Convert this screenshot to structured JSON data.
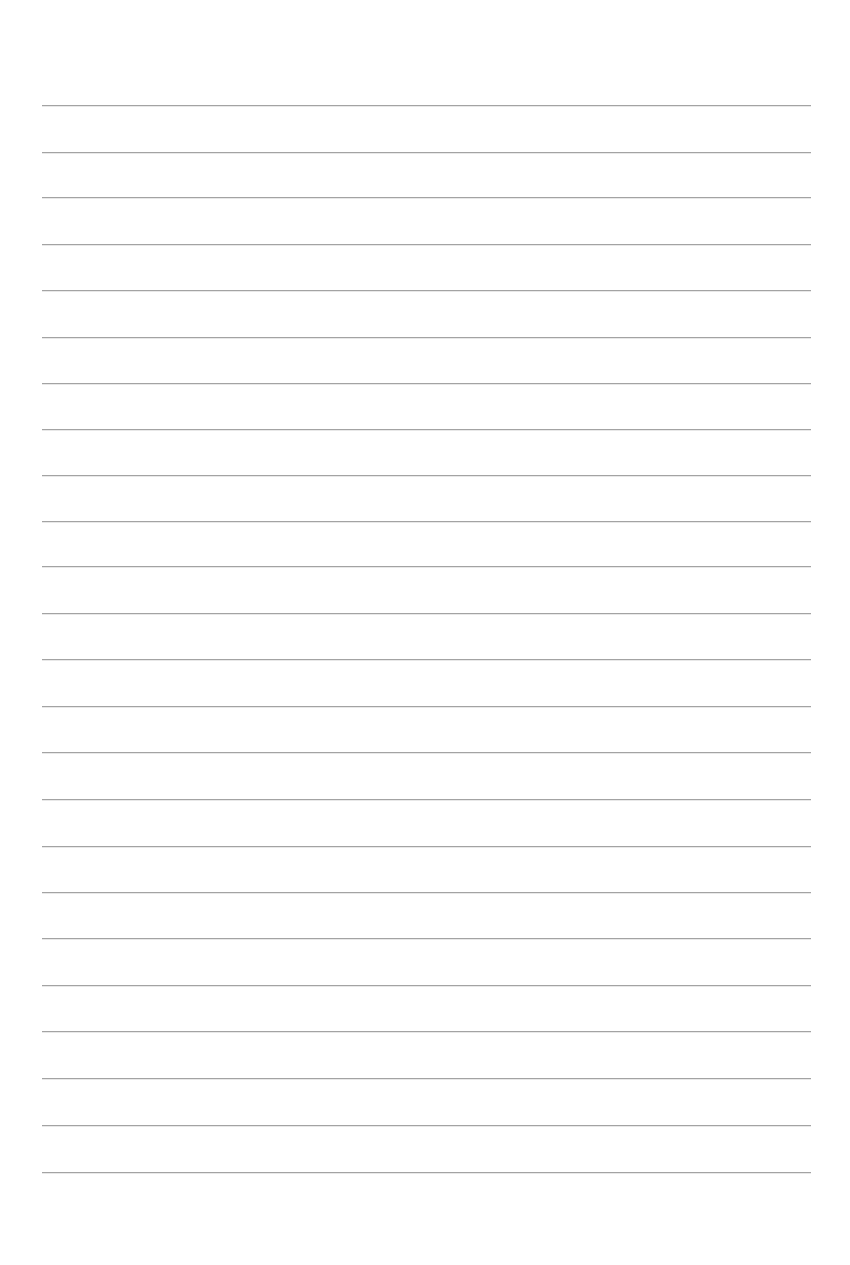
{
  "document": {
    "type": "lined-paper",
    "background_color": "#ffffff",
    "rule_color": "#a3a3a3",
    "rule_count": 24,
    "rule_left": 42,
    "rule_right": 811,
    "rule_positions": [
      105,
      152,
      197,
      244,
      290,
      337,
      383,
      429,
      475,
      521,
      566,
      613,
      659,
      706,
      752,
      799,
      846,
      892,
      938,
      985,
      1031,
      1078,
      1125,
      1172
    ],
    "text_lines": []
  }
}
